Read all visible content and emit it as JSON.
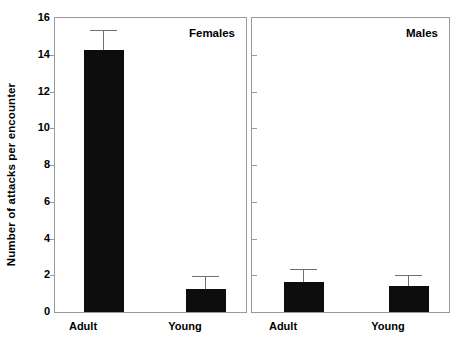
{
  "chart_data": {
    "type": "bar",
    "title": "",
    "xlabel": "",
    "ylabel": "Number of attacks per encounter",
    "ylim": [
      0,
      16
    ],
    "yticks": [
      0,
      2,
      4,
      6,
      8,
      10,
      12,
      14,
      16
    ],
    "grid": false,
    "legend": false,
    "error_bars": "upper-only (SEM)",
    "categories": [
      "Adult",
      "Young"
    ],
    "panels": [
      {
        "name": "Females",
        "categories": [
          "Adult",
          "Young"
        ],
        "values": [
          14.25,
          1.25
        ],
        "errors": [
          1.05,
          0.65
        ]
      },
      {
        "name": "Males",
        "categories": [
          "Adult",
          "Young"
        ],
        "values": [
          1.65,
          1.4
        ],
        "errors": [
          0.65,
          0.55
        ]
      }
    ],
    "colors": {
      "bar": "#0d0d0d",
      "error": "#6f6f6f",
      "axis": "#9a9a9a",
      "text": "#000000",
      "background": "#ffffff"
    }
  },
  "axis": {
    "y_title": "Number of attacks per encounter",
    "y_tick_labels": [
      "16",
      "14",
      "12",
      "10",
      "8",
      "6",
      "4",
      "2",
      "0"
    ]
  },
  "panels": {
    "females": {
      "title": "Females",
      "bars": [
        {
          "label": "Adult",
          "value": 14.25,
          "error": 1.05
        },
        {
          "label": "Young",
          "value": 1.25,
          "error": 0.65
        }
      ]
    },
    "males": {
      "title": "Males",
      "bars": [
        {
          "label": "Adult",
          "value": 1.65,
          "error": 0.65
        },
        {
          "label": "Young",
          "value": 1.4,
          "error": 0.55
        }
      ]
    }
  }
}
